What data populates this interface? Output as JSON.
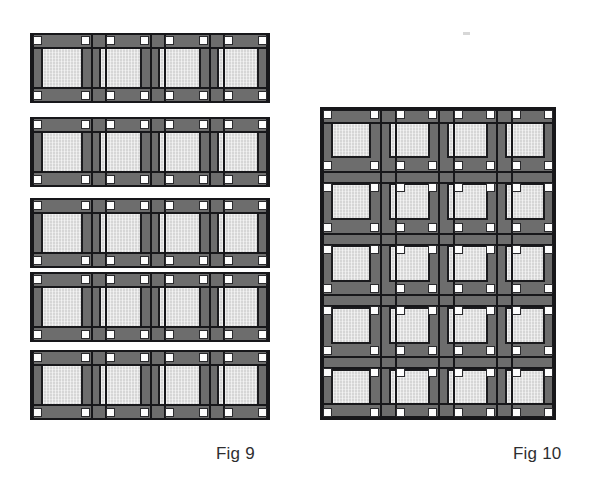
{
  "figure": {
    "kind": "technical-assembly-diagram",
    "background_color": "#ffffff"
  },
  "captions": [
    {
      "id": "fig9",
      "label": "Fig 9",
      "x": 216,
      "y": 452
    },
    {
      "id": "fig10",
      "label": "Fig 10",
      "x": 513,
      "y": 452
    }
  ],
  "palette": {
    "frame_gray": "#6d6d6d",
    "panel_gray": "#d6d6d6",
    "outline_black": "#17171a",
    "node_white": "#fdfdfd",
    "caption_text": "#2e2e30"
  },
  "fig9": {
    "name": "Fig 9",
    "description": "Five separate single-storey frame strips, each four panels wide",
    "strip_count": 5,
    "panels_per_strip": 4,
    "left": 30,
    "width": 240,
    "strip_height": 70,
    "strip_tops": [
      33,
      117,
      198,
      272,
      350
    ],
    "rail_thickness": 12,
    "mullion_thickness": 16,
    "node_size": 9
  },
  "fig10": {
    "name": "Fig 10",
    "description": "Assembled multi-storey curtain wall grid, four panels wide by five storeys high",
    "columns": 4,
    "rows": 5,
    "left": 320,
    "top": 107,
    "width": 236,
    "height": 313,
    "row_tops": [
      107,
      172,
      236,
      300,
      358
    ],
    "rail_thickness": 13,
    "mullion_thickness": 17,
    "node_size": 9
  }
}
